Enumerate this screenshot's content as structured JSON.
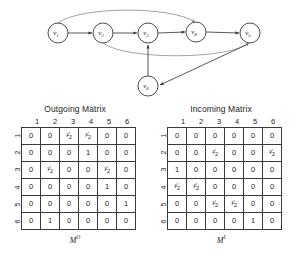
{
  "graph": {
    "name": "directed-graph",
    "nodes": [
      {
        "id": "v1",
        "label": "v",
        "sub": "1",
        "cx": 58,
        "cy": 33
      },
      {
        "id": "v2",
        "label": "v",
        "sub": "2",
        "cx": 103,
        "cy": 33
      },
      {
        "id": "v3",
        "label": "v",
        "sub": "3",
        "cx": 148,
        "cy": 33
      },
      {
        "id": "v4",
        "label": "v",
        "sub": "4",
        "cx": 196,
        "cy": 32
      },
      {
        "id": "v5",
        "label": "v",
        "sub": "5",
        "cx": 250,
        "cy": 33
      },
      {
        "id": "v6",
        "label": "v",
        "sub": "6",
        "cx": 148,
        "cy": 86
      }
    ],
    "edges": [
      {
        "from": "v1",
        "to": "v2",
        "kind": "straight"
      },
      {
        "from": "v2",
        "to": "v3",
        "kind": "straight"
      },
      {
        "from": "v3",
        "to": "v4",
        "kind": "straight"
      },
      {
        "from": "v4",
        "to": "v5",
        "kind": "straight"
      },
      {
        "from": "v1",
        "to": "v4",
        "kind": "curve-above"
      },
      {
        "from": "v2",
        "to": "v5",
        "kind": "curve-below"
      },
      {
        "from": "v6",
        "to": "v3",
        "kind": "straight"
      },
      {
        "from": "v5",
        "to": "v6",
        "kind": "straight"
      }
    ]
  },
  "outgoing_matrix": {
    "title": "Outgoing Matrix",
    "caption_base": "M",
    "caption_sup": "O",
    "col_headers": [
      "1",
      "2",
      "3",
      "4",
      "5",
      "6"
    ],
    "row_headers": [
      "1",
      "2",
      "3",
      "4",
      "5",
      "6"
    ],
    "rows": [
      [
        "0",
        "0",
        "1/2",
        "1/2",
        "0",
        "0"
      ],
      [
        "0",
        "0",
        "0",
        "1",
        "0",
        "0"
      ],
      [
        "0",
        "1/2",
        "0",
        "0",
        "1/2",
        "0"
      ],
      [
        "0",
        "0",
        "0",
        "0",
        "1",
        "0"
      ],
      [
        "0",
        "0",
        "0",
        "0",
        "0",
        "1"
      ],
      [
        "0",
        "1",
        "0",
        "0",
        "0",
        "0"
      ]
    ]
  },
  "incoming_matrix": {
    "title": "Incoming Matrix",
    "caption_base": "M",
    "caption_sup": "I",
    "col_headers": [
      "1",
      "2",
      "3",
      "4",
      "5",
      "6"
    ],
    "row_headers": [
      "1",
      "2",
      "3",
      "4",
      "5",
      "6"
    ],
    "rows": [
      [
        "0",
        "0",
        "0",
        "0",
        "0",
        "0"
      ],
      [
        "0",
        "0",
        "1/2",
        "0",
        "0",
        "1/2"
      ],
      [
        "1",
        "0",
        "0",
        "0",
        "0",
        "0"
      ],
      [
        "1/2",
        "1/2",
        "0",
        "0",
        "0",
        "0"
      ],
      [
        "0",
        "0",
        "1/2",
        "1/2",
        "0",
        "0"
      ],
      [
        "0",
        "0",
        "0",
        "0",
        "1",
        "0"
      ]
    ]
  },
  "colors": {
    "ink": "#1c1c1c",
    "stroke": "#3a3a3a",
    "curve": "#8a8a8a",
    "background": "#ffffff"
  }
}
